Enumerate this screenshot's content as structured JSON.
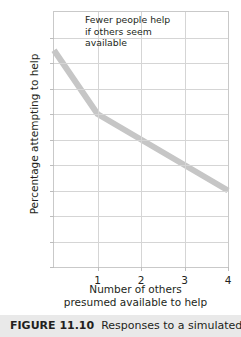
{
  "figure": {
    "caption_label": "FIGURE 11.10",
    "caption_text": "Responses to a simulated"
  },
  "chart_data": {
    "type": "line",
    "title": "",
    "xlabel_line1": "Number of others",
    "xlabel_line2": "presumed available to help",
    "ylabel": "Percentage attempting to help",
    "x": [
      0,
      1,
      2,
      3,
      4
    ],
    "values": [
      85,
      60,
      50,
      40,
      30
    ],
    "series": [
      {
        "name": "Percentage attempting to help",
        "values": [
          85,
          60,
          50,
          40,
          30
        ]
      }
    ],
    "xtick_labels": [
      "1",
      "2",
      "3",
      "4"
    ],
    "xtick_values": [
      1,
      2,
      3,
      4
    ],
    "ytick_labels": [
      "90%",
      "80",
      "70",
      "60",
      "50",
      "40",
      "30",
      "20",
      "10",
      "0"
    ],
    "ytick_values": [
      90,
      80,
      70,
      60,
      50,
      40,
      30,
      20,
      10,
      0
    ],
    "xlim": [
      0,
      4
    ],
    "ylim": [
      0,
      100
    ],
    "grid": true,
    "legend": "none",
    "line_color": "#c6c6c6",
    "grid_color": "#d5d5d5",
    "frame_color": "#c9c9c9",
    "text_color": "#231f20",
    "annotation": {
      "line1": "Fewer people help",
      "line2": "if others seem",
      "line3": "available"
    }
  }
}
